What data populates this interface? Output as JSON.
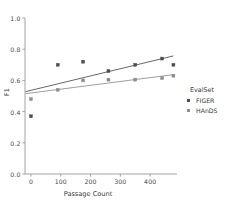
{
  "chart_data": {
    "type": "scatter",
    "title": "",
    "xlabel": "Passage Count",
    "ylabel": "F1",
    "xlim": [
      -20,
      490
    ],
    "ylim": [
      0.0,
      1.0
    ],
    "xticks": [
      0,
      100,
      200,
      300,
      400
    ],
    "xtick_labels": [
      "0",
      "100",
      "200",
      "300",
      "400"
    ],
    "yticks": [
      0.0,
      0.2,
      0.4,
      0.6,
      0.8,
      1.0
    ],
    "ytick_labels": [
      "0.0",
      "0.2",
      "0.4",
      "0.6",
      "0.8",
      "1.0"
    ],
    "grid": false,
    "legend": {
      "title": "EvalSet",
      "position": "right",
      "entries": [
        {
          "label": "FIGER",
          "color": "#4d4d4d",
          "marker": "square"
        },
        {
          "label": "HAnDS",
          "color": "#8c8c8c",
          "marker": "square"
        }
      ]
    },
    "series": [
      {
        "name": "FIGER",
        "color": "#4d4d4d",
        "marker": "square",
        "points": [
          {
            "x": 0,
            "y": 0.37
          },
          {
            "x": 90,
            "y": 0.7
          },
          {
            "x": 175,
            "y": 0.72
          },
          {
            "x": 260,
            "y": 0.66
          },
          {
            "x": 350,
            "y": 0.7
          },
          {
            "x": 440,
            "y": 0.74
          },
          {
            "x": 478,
            "y": 0.7
          }
        ],
        "trendline": {
          "x0": -18,
          "y0": 0.528,
          "x1": 478,
          "y1": 0.757
        }
      },
      {
        "name": "HAnDS",
        "color": "#8c8c8c",
        "marker": "square",
        "points": [
          {
            "x": 0,
            "y": 0.48
          },
          {
            "x": 90,
            "y": 0.54
          },
          {
            "x": 175,
            "y": 0.6
          },
          {
            "x": 260,
            "y": 0.605
          },
          {
            "x": 350,
            "y": 0.605
          },
          {
            "x": 440,
            "y": 0.615
          },
          {
            "x": 478,
            "y": 0.63
          }
        ],
        "trendline": {
          "x0": -18,
          "y0": 0.515,
          "x1": 478,
          "y1": 0.637
        }
      }
    ],
    "axes_color": "#9a9a9a"
  }
}
